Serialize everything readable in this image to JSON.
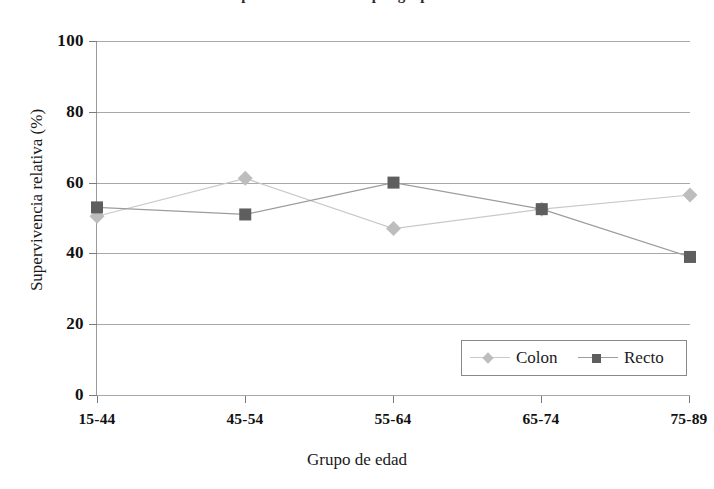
{
  "figure": {
    "title_remnant": "Supervivencia relativa por grupo de edad",
    "background_color": "#ffffff"
  },
  "axes": {
    "y_title": "Supervivencia relativa (%)",
    "x_title": "Grupo de edad",
    "y_ticks": [
      "100",
      "80",
      "60",
      "40",
      "20",
      "0"
    ],
    "x_ticks": [
      "15-44",
      "45-54",
      "55-64",
      "65-74",
      "75-89"
    ]
  },
  "legend": {
    "position": "inside-bottom-right",
    "entries": [
      {
        "label": "Colon",
        "marker": "diamond",
        "color": "#bdbdbd"
      },
      {
        "label": "Recto",
        "marker": "square",
        "color": "#5e5e5e"
      }
    ]
  },
  "chart_data": {
    "type": "line",
    "title": "Supervivencia relativa por grupo de edad",
    "subtitle": "",
    "xlabel": "Grupo de edad",
    "ylabel": "Supervivencia relativa (%)",
    "categories": [
      "15-44",
      "45-54",
      "55-64",
      "65-74",
      "75-89"
    ],
    "ylim": [
      0,
      100
    ],
    "yticks": [
      0,
      20,
      40,
      60,
      80,
      100
    ],
    "grid": "horizontal",
    "legend_position": "lower right",
    "series": [
      {
        "name": "Colon",
        "marker": "diamond",
        "color": "#bdbdbd",
        "line_color": "#c9c9c9",
        "values": [
          50.5,
          61.2,
          47.0,
          52.5,
          56.5
        ]
      },
      {
        "name": "Recto",
        "marker": "square",
        "color": "#5e5e5e",
        "line_color": "#9c9c9c",
        "values": [
          53.0,
          51.0,
          60.0,
          52.5,
          39.0
        ]
      }
    ]
  }
}
